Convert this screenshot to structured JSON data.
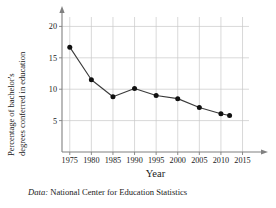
{
  "figure": {
    "caption_key": "Data:",
    "caption_text": " National Center for Education Statistics"
  },
  "chart_data": {
    "type": "line",
    "title": "",
    "xlabel": "Year",
    "ylabel": "Percentage of bachelor's degrees conferred in education",
    "ylabel_line1": "Percentage of bachelor's",
    "ylabel_line2": "degrees conferred in education",
    "x": [
      1975,
      1980,
      1985,
      1990,
      1995,
      2000,
      2005,
      2010,
      2012
    ],
    "values": [
      16.7,
      11.5,
      8.8,
      10.1,
      9.0,
      8.5,
      7.1,
      6.1,
      5.8
    ],
    "xlim": [
      1973.2,
      2016.5
    ],
    "ylim": [
      0,
      21.5
    ],
    "xticks": [
      1975,
      1980,
      1985,
      1990,
      1995,
      2000,
      2005,
      2010,
      2015
    ],
    "xtick_labels": [
      "1975",
      "1980",
      "1985",
      "1990",
      "1995",
      "2000",
      "2005",
      "2010",
      "2015"
    ],
    "yticks": [
      5,
      10,
      15,
      20
    ],
    "ytick_labels": [
      "5",
      "10",
      "15",
      "20"
    ],
    "grid": true,
    "legend": "none",
    "marker": "filled-circle",
    "line_color": "#3a3a3a",
    "marker_color": "#111111",
    "grid_color": "#c8c8c8",
    "axis_color": "#808080"
  }
}
